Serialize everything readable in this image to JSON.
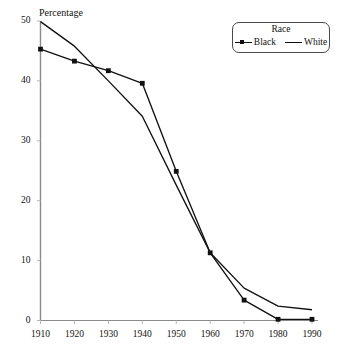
{
  "chart_data": {
    "type": "line",
    "title": "",
    "ylabel": "Percentage",
    "xlabel": "",
    "x": [
      1910,
      1920,
      1930,
      1940,
      1950,
      1960,
      1970,
      1980,
      1990
    ],
    "xtick_labels": [
      "1910",
      "1920",
      "1930",
      "1940",
      "1950",
      "1960",
      "1970",
      "1980",
      "1990"
    ],
    "ytick_labels": [
      "0",
      "10",
      "20",
      "30",
      "40",
      "50"
    ],
    "ytick_values": [
      0,
      10,
      20,
      30,
      40,
      50
    ],
    "xlim": [
      1910,
      1990
    ],
    "ylim": [
      0,
      50
    ],
    "grid": false,
    "legend_title": "Race",
    "legend_position": "top-right",
    "series": [
      {
        "name": "Black",
        "marker": "filled-square",
        "color": "#111111",
        "values": [
          45.3,
          43.3,
          41.7,
          39.6,
          24.9,
          11.3,
          3.4,
          0.2,
          0.2
        ]
      },
      {
        "name": "White",
        "marker": "none",
        "color": "#111111",
        "values": [
          49.9,
          45.8,
          40.0,
          34.1,
          22.6,
          11.3,
          5.4,
          2.4,
          1.8
        ]
      }
    ]
  },
  "legend": {
    "title": "Race",
    "items": [
      {
        "label": "Black",
        "swatch": "line-with-square-marker-icon"
      },
      {
        "label": "White",
        "swatch": "plain-line-icon"
      }
    ]
  },
  "axes": {
    "y_axis_title": "Percentage",
    "y_ticks": [
      "0",
      "10",
      "20",
      "30",
      "40",
      "50"
    ],
    "x_ticks": [
      "1910",
      "1920",
      "1930",
      "1940",
      "1950",
      "1960",
      "1970",
      "1980",
      "1990"
    ]
  }
}
